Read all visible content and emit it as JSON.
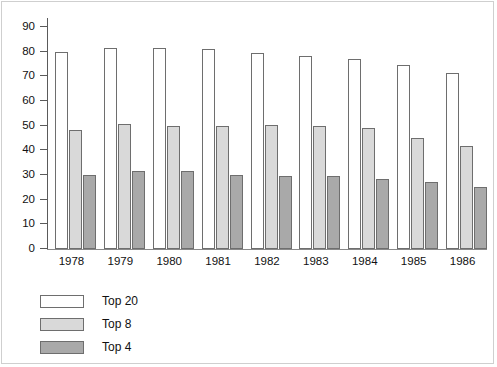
{
  "chart_data": {
    "type": "bar",
    "title": "",
    "subtitle": "",
    "xlabel": "",
    "ylabel": "",
    "categories": [
      "1978",
      "1979",
      "1980",
      "1981",
      "1982",
      "1983",
      "1984",
      "1985",
      "1986"
    ],
    "series": [
      {
        "name": "Top 20",
        "color": "#ffffff",
        "values": [
          79.8,
          81.5,
          81.6,
          81.0,
          79.5,
          78.3,
          77.2,
          74.8,
          71.5
        ]
      },
      {
        "name": "Top 8",
        "color": "#d9d9d9",
        "values": [
          48.3,
          50.5,
          50.0,
          50.0,
          50.2,
          49.8,
          49.0,
          45.0,
          41.8
        ]
      },
      {
        "name": "Top 4",
        "color": "#a9a9a9",
        "values": [
          30.0,
          31.8,
          31.5,
          30.0,
          29.7,
          29.4,
          28.5,
          27.2,
          25.0
        ]
      }
    ],
    "ylim": [
      0,
      90
    ],
    "yticks": [
      0,
      10,
      20,
      30,
      40,
      50,
      60,
      70,
      80,
      90
    ],
    "ytick_labels": [
      "0",
      "10",
      "20",
      "30",
      "40",
      "50",
      "60",
      "70",
      "80",
      "90"
    ],
    "grid": false,
    "legend_position": "below-left",
    "bar_outline_color": "#6e6e6e",
    "axis_color": "#5a5a5a"
  },
  "legend": {
    "entries": [
      {
        "label": "Top 20",
        "swatch": "white-swatch"
      },
      {
        "label": "Top 8",
        "swatch": "light-gray-swatch"
      },
      {
        "label": "Top 4",
        "swatch": "dark-gray-swatch"
      }
    ]
  }
}
